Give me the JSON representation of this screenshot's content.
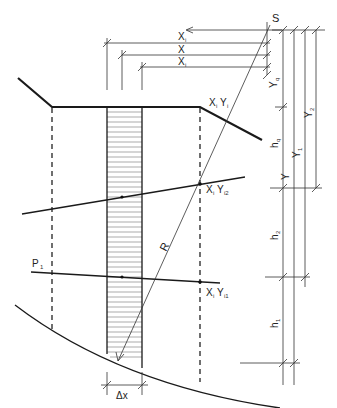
{
  "diagram": {
    "colors": {
      "line": "#1a1a1a",
      "background": "#ffffff"
    },
    "labels": {
      "center": "S",
      "x_i_top": "X",
      "x_i_top_sub": "i",
      "x_mid": "X",
      "x_i_low": "X",
      "x_i_low_sub": "i",
      "y_q": "Y",
      "y_q_sub": "q",
      "y_2": "Y",
      "y_2_sub": "2",
      "h_q": "h",
      "h_q_sub": "q",
      "y_1": "Y",
      "y_1_sub": "1",
      "y": "Y",
      "h_2": "h",
      "h_2_sub": "2",
      "h_1": "h",
      "h_1_sub": "1",
      "radius": "R",
      "point_top": "X",
      "point_top_sub1": "i",
      "point_top_y": "Y",
      "point_top_sub2": "i",
      "point_mid": "X",
      "point_mid_sub1": "i",
      "point_mid_y": "Y",
      "point_mid_sub2": "i2",
      "point_low": "X",
      "point_low_sub1": "i",
      "point_low_y": "Y",
      "point_low_sub2": "i1",
      "p1": "P",
      "p1_sub": "1",
      "delta_x": "Δx"
    }
  }
}
